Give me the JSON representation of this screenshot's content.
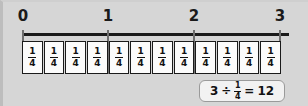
{
  "figure": {
    "name": "number-line-division-by-unit-fraction",
    "background_color": "#d6d6d6",
    "line_color": "#1a1a1a",
    "tick_color": "#6e6e6e",
    "cell_fill": "#fbfbfb"
  },
  "numberline": {
    "ticks": [
      {
        "label": "0",
        "value": 0,
        "x": 20
      },
      {
        "label": "1",
        "value": 1,
        "x": 105
      },
      {
        "label": "2",
        "value": 2,
        "x": 191
      },
      {
        "label": "3",
        "value": 3,
        "x": 277
      }
    ],
    "range": [
      0,
      3
    ]
  },
  "fraction_strip": {
    "count": 12,
    "numerator": "1",
    "denominator": "4",
    "cells": [
      {
        "numerator": "1",
        "denominator": "4"
      },
      {
        "numerator": "1",
        "denominator": "4"
      },
      {
        "numerator": "1",
        "denominator": "4"
      },
      {
        "numerator": "1",
        "denominator": "4"
      },
      {
        "numerator": "1",
        "denominator": "4"
      },
      {
        "numerator": "1",
        "denominator": "4"
      },
      {
        "numerator": "1",
        "denominator": "4"
      },
      {
        "numerator": "1",
        "denominator": "4"
      },
      {
        "numerator": "1",
        "denominator": "4"
      },
      {
        "numerator": "1",
        "denominator": "4"
      },
      {
        "numerator": "1",
        "denominator": "4"
      },
      {
        "numerator": "1",
        "denominator": "4"
      }
    ]
  },
  "equation": {
    "dividend": "3",
    "divide_sign": "÷",
    "divisor_numerator": "1",
    "divisor_denominator": "4",
    "equals_sign": "=",
    "result": "12",
    "text": "3 ÷ 1/4 = 12"
  }
}
